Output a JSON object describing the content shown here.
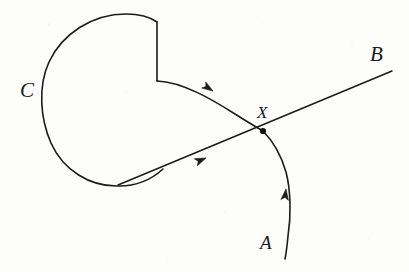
{
  "figure": {
    "kind": "hand-drawn-diagram",
    "background_color": "#fdfdfb",
    "ink_color": "#1b1b1f",
    "stroke_width": 1.6
  },
  "labels": {
    "c": "C",
    "b": "B",
    "x": "X",
    "a": "A"
  },
  "annotations": {
    "intersection_point_label": "X",
    "loop_label": "C",
    "ray_end_label": "B",
    "curve_start_label": "A"
  },
  "paths": {
    "loop_arc": "M 157 22 C 150 17 138 14 126 14 C 92 14 62 34 49 62 C 38 86 40 118 51 143 C 63 170 90 187 119 186 C 136 186 151 180 163 169",
    "notch_vertical": "M 157 22 L 157 81",
    "notch_to_curve": "M 157 81 C 176 81 196 88 213 99",
    "arc_upper_to_x": "M 157 81 C 183 82 213 100 235 114 C 246 121 256 127 263 131",
    "arc_x_to_a": "M 263 131 C 272 140 281 155 286 172 C 291 191 291 217 288 236 C 287 247 286 254 285 259",
    "ray_b": "M 118 185 L 392 71"
  },
  "arrowheads": [
    {
      "name": "arrow-on-upper-arc",
      "x": 213,
      "y": 91,
      "angle_deg": 213
    },
    {
      "name": "arrow-on-ray",
      "x": 205,
      "y": 159,
      "angle_deg": 337
    },
    {
      "name": "arrow-on-lower-arc",
      "x": 286,
      "y": 189,
      "angle_deg": 277
    }
  ],
  "node": {
    "name": "intersection-dot",
    "x": 263,
    "y": 131,
    "r": 3.1
  }
}
